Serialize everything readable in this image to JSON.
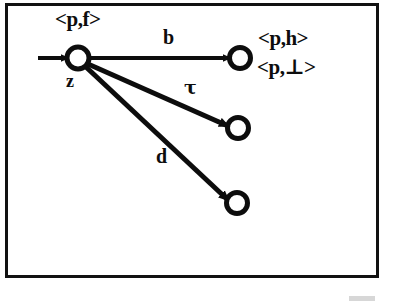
{
  "figure": {
    "kind": "labelled-transition-diagram",
    "background_color": "#ffffff",
    "stroke_color": "#0d0d0d",
    "frame": {
      "x": 5,
      "y": 3,
      "width": 373,
      "height": 274,
      "border_width": 3
    }
  },
  "nodes": [
    {
      "id": "source",
      "name": "z",
      "cx": 78,
      "cy": 58,
      "r": 11,
      "stroke_width": 5,
      "fill": "#ffffff",
      "label_above": "<p,f>",
      "label_below": "z"
    },
    {
      "id": "target-b",
      "name": "b-target",
      "cx": 240,
      "cy": 58,
      "r": 10,
      "stroke_width": 5,
      "fill": "#ffffff"
    },
    {
      "id": "target-tau",
      "name": "tau-target",
      "cx": 238,
      "cy": 128,
      "r": 10,
      "stroke_width": 5,
      "fill": "#ffffff"
    },
    {
      "id": "target-d",
      "name": "d-target",
      "cx": 237,
      "cy": 203,
      "r": 10,
      "stroke_width": 5,
      "fill": "#ffffff"
    }
  ],
  "entry_arrow": {
    "name": "initial-state-arrow",
    "x1": 38,
    "y1": 58,
    "x2": 66,
    "y2": 58,
    "stroke_width": 4
  },
  "edges": [
    {
      "id": "edge-b",
      "label": "b",
      "from": "source",
      "to": "target-b",
      "x1": 89,
      "y1": 58,
      "x2": 228,
      "y2": 58,
      "stroke_width": 4
    },
    {
      "id": "edge-tau",
      "label": "τ",
      "from": "source",
      "to": "target-tau",
      "x1": 88,
      "y1": 63,
      "x2": 226,
      "y2": 125,
      "stroke_width": 5
    },
    {
      "id": "edge-d",
      "label": "d",
      "from": "source",
      "to": "target-d",
      "x1": 86,
      "y1": 66,
      "x2": 226,
      "y2": 198,
      "stroke_width": 5
    }
  ],
  "labels": {
    "source_state": "<p,f>",
    "source_node_name": "z",
    "target_state_primary": "<p,h>",
    "target_state_secondary": "<p,⊥>",
    "edge_b": "b",
    "edge_tau": "τ",
    "edge_d": "d"
  }
}
